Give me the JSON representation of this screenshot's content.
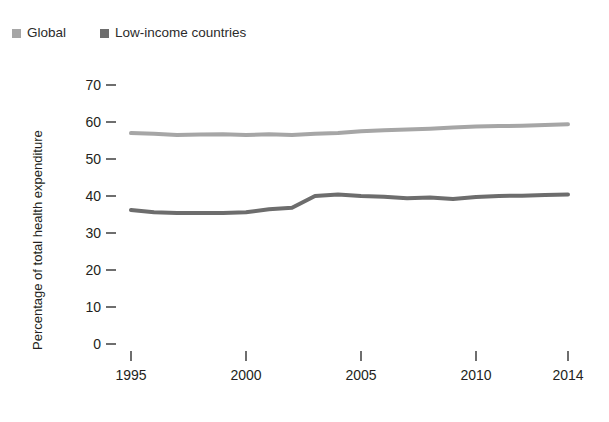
{
  "legend": {
    "position": "top-left",
    "items": [
      {
        "label": "Global",
        "color": "#a6a6a6",
        "marker": "square-swatch"
      },
      {
        "label": "Low-income countries",
        "color": "#6d6d6d",
        "marker": "square-swatch"
      }
    ]
  },
  "axes": {
    "y_title": "Percentage of total health expenditure",
    "y_ticks": [
      "70",
      "60",
      "50",
      "40",
      "30",
      "20",
      "10",
      "0"
    ],
    "x_ticks": [
      "1995",
      "2000",
      "2005",
      "2010",
      "2014"
    ]
  },
  "chart_data": {
    "type": "line",
    "title": "",
    "subtitle": "",
    "xlabel": "",
    "ylabel": "Percentage of total health expenditure",
    "xlim": [
      1995,
      2014
    ],
    "ylim": [
      0,
      70
    ],
    "yticks": [
      0,
      10,
      20,
      30,
      40,
      50,
      60,
      70
    ],
    "xticks": [
      1995,
      2000,
      2005,
      2010,
      2014
    ],
    "grid": false,
    "legend_position": "top-left",
    "x": [
      1995,
      1996,
      1997,
      1998,
      1999,
      2000,
      2001,
      2002,
      2003,
      2004,
      2005,
      2006,
      2007,
      2008,
      2009,
      2010,
      2011,
      2012,
      2013,
      2014
    ],
    "series": [
      {
        "name": "Global",
        "color": "#a6a6a6",
        "values": [
          57.0,
          56.8,
          56.5,
          56.6,
          56.7,
          56.5,
          56.7,
          56.5,
          56.8,
          57.0,
          57.5,
          57.8,
          58.0,
          58.2,
          58.5,
          58.8,
          58.9,
          59.0,
          59.2,
          59.4
        ]
      },
      {
        "name": "Low-income countries",
        "color": "#6d6d6d",
        "values": [
          36.2,
          35.6,
          35.4,
          35.4,
          35.4,
          35.6,
          36.4,
          36.8,
          40.0,
          40.4,
          40.0,
          39.8,
          39.4,
          39.6,
          39.2,
          39.7,
          40.0,
          40.1,
          40.3,
          40.4
        ]
      }
    ]
  },
  "top_cut_text": ""
}
